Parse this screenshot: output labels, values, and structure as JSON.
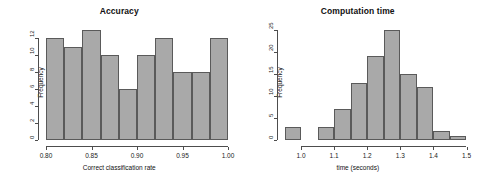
{
  "chart_data": [
    {
      "type": "bar",
      "title": "Accuracy",
      "xlabel": "Correct classification rate",
      "ylabel": "Frequency",
      "xlim": [
        0.8,
        1.0
      ],
      "ylim": [
        0,
        13
      ],
      "xticks": [
        "0.80",
        "0.85",
        "0.90",
        "0.95",
        "1.00"
      ],
      "xtick_values": [
        0.8,
        0.85,
        0.9,
        0.95,
        1.0
      ],
      "yticks": [
        "0",
        "2",
        "4",
        "6",
        "8",
        "10",
        "12"
      ],
      "ytick_values": [
        0,
        2,
        4,
        6,
        8,
        10,
        12
      ],
      "bin_edges": [
        0.8,
        0.82,
        0.84,
        0.86,
        0.88,
        0.9,
        0.92,
        0.94,
        0.96,
        0.98,
        1.0
      ],
      "categories": [
        "0.80-0.82",
        "0.82-0.84",
        "0.84-0.86",
        "0.86-0.88",
        "0.88-0.90",
        "0.90-0.92",
        "0.92-0.94",
        "0.94-0.96",
        "0.96-0.98",
        "0.98-1.00"
      ],
      "values": [
        12,
        11,
        13,
        10,
        6,
        10,
        12,
        8,
        8,
        12
      ],
      "grid": false,
      "legend": "none",
      "bar_fill": "#a9a9a9",
      "bar_border": "#5a5a5a"
    },
    {
      "type": "bar",
      "title": "Computation time",
      "xlabel": "time (seconds)",
      "ylabel": "Frequency",
      "xlim": [
        0.95,
        1.5
      ],
      "ylim": [
        0,
        25
      ],
      "xticks": [
        "1.0",
        "1.1",
        "1.2",
        "1.3",
        "1.4",
        "1.5"
      ],
      "xtick_values": [
        1.0,
        1.1,
        1.2,
        1.3,
        1.4,
        1.5
      ],
      "yticks": [
        "0",
        "5",
        "10",
        "15",
        "20",
        "25"
      ],
      "ytick_values": [
        0,
        5,
        10,
        15,
        20,
        25
      ],
      "bin_edges": [
        0.95,
        1.0,
        1.05,
        1.1,
        1.15,
        1.2,
        1.25,
        1.3,
        1.35,
        1.4,
        1.45,
        1.5
      ],
      "categories": [
        "0.95-1.00",
        "1.00-1.05",
        "1.05-1.10",
        "1.10-1.15",
        "1.15-1.20",
        "1.20-1.25",
        "1.25-1.30",
        "1.30-1.35",
        "1.35-1.40",
        "1.40-1.45",
        "1.45-1.50"
      ],
      "values": [
        3,
        0,
        3,
        7,
        13,
        19,
        25,
        15,
        12,
        2,
        1
      ],
      "grid": false,
      "legend": "none",
      "bar_fill": "#a9a9a9",
      "bar_border": "#5a5a5a"
    }
  ]
}
